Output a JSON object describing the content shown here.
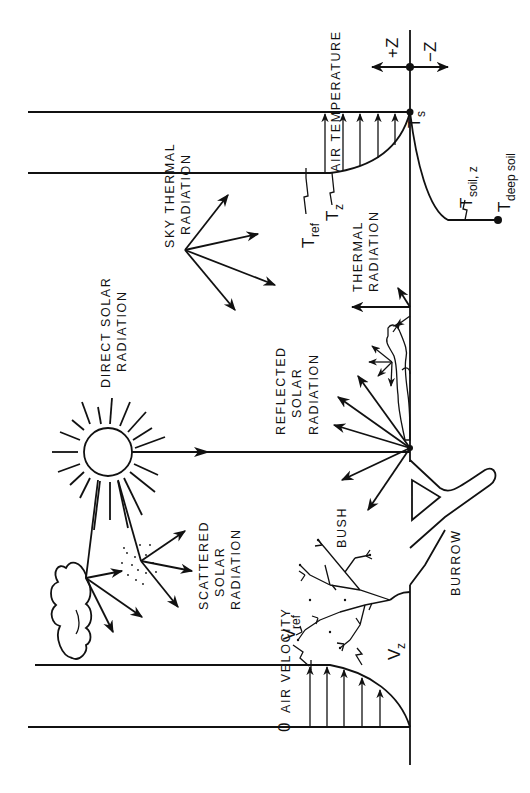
{
  "diagram": {
    "orientation": "rotated 90 degrees counter-clockwise",
    "labels": {
      "air_temperature": "AIR TEMPERATURE",
      "sky_thermal_1": "SKY THERMAL",
      "sky_thermal_2": "RADIATION",
      "direct_solar_1": "DIRECT SOLAR",
      "direct_solar_2": "RADIATION",
      "reflected_1": "REFLECTED",
      "reflected_2": "SOLAR",
      "reflected_3": "RADIATION",
      "thermal_1": "THERMAL",
      "thermal_2": "RADIATION",
      "scattered_1": "SCATTERED",
      "scattered_2": "SOLAR",
      "scattered_3": "RADIATION",
      "bush": "BUSH",
      "burrow": "BURROW",
      "air_velocity": "AIR VELOCITY",
      "zero": "0"
    },
    "symbols": {
      "plus_z": "+Z",
      "minus_z": "−Z",
      "t_s_main": "T",
      "t_s_sub": "s",
      "t_ref_main": "T",
      "t_ref_sub": "ref",
      "t_z_main": "T",
      "t_z_sub": "z",
      "t_soil_main": "T",
      "t_soil_sub": "soil, z",
      "t_deep_main": "T",
      "t_deep_sub": "deep soil",
      "v_ref_main": "V",
      "v_ref_sub": "ref",
      "v_z_main": "V",
      "v_z_sub": "z"
    },
    "colors": {
      "ink": "#111111",
      "background": "#ffffff"
    }
  }
}
